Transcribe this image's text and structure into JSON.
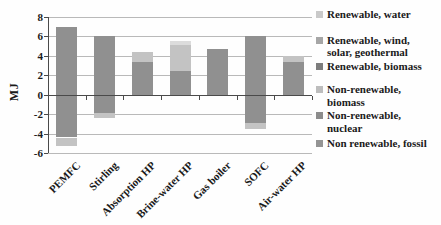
{
  "chart_data": {
    "type": "bar",
    "stacked": true,
    "title": "",
    "xlabel": "",
    "ylabel": "MJ",
    "ylim": [
      -6,
      8
    ],
    "yticks": [
      8,
      6,
      4,
      2,
      0,
      -2,
      -4,
      -6
    ],
    "grid": "horizontal",
    "legend_position": "right",
    "categories": [
      "PEMFC",
      "Stirling",
      "Absorption HP",
      "Brine-water HP",
      "Gas boiler",
      "SOFC",
      "Air-water HP"
    ],
    "shade_colors": {
      "dark": "#909090",
      "light": "#c3c3c3",
      "lightest": "#dcdcdc"
    },
    "bars": [
      {
        "category": "PEMFC",
        "segments": [
          {
            "shade": "dark",
            "from": 0,
            "to": 7.0
          },
          {
            "shade": "dark",
            "from": 0,
            "to": -4.4
          },
          {
            "shade": "light",
            "from": -4.4,
            "to": -5.3
          }
        ]
      },
      {
        "category": "Stirling",
        "segments": [
          {
            "shade": "dark",
            "from": 0,
            "to": 6.0
          },
          {
            "shade": "dark",
            "from": 0,
            "to": -1.9
          },
          {
            "shade": "light",
            "from": -1.9,
            "to": -2.4
          }
        ]
      },
      {
        "category": "Absorption HP",
        "segments": [
          {
            "shade": "dark",
            "from": 0,
            "to": 3.4
          },
          {
            "shade": "light",
            "from": 3.4,
            "to": 4.4
          }
        ]
      },
      {
        "category": "Brine-water HP",
        "segments": [
          {
            "shade": "dark",
            "from": 0,
            "to": 2.4
          },
          {
            "shade": "light",
            "from": 2.4,
            "to": 5.1
          },
          {
            "shade": "lightest",
            "from": 5.1,
            "to": 5.5
          }
        ]
      },
      {
        "category": "Gas boiler",
        "segments": [
          {
            "shade": "dark",
            "from": 0,
            "to": 4.7
          }
        ]
      },
      {
        "category": "SOFC",
        "segments": [
          {
            "shade": "dark",
            "from": 0,
            "to": 6.1
          },
          {
            "shade": "dark",
            "from": 0,
            "to": -2.9
          },
          {
            "shade": "light",
            "from": -2.9,
            "to": -3.5
          }
        ]
      },
      {
        "category": "Air-water HP",
        "segments": [
          {
            "shade": "dark",
            "from": 0,
            "to": 3.4
          },
          {
            "shade": "light",
            "from": 3.4,
            "to": 4.0
          }
        ]
      }
    ],
    "legend": [
      {
        "label": "Renewable, water",
        "color": "#c9c9c9"
      },
      {
        "label": "Renewable, wind, solar, geothermal",
        "color": "#a6a6a6"
      },
      {
        "label": "Renewable, biomass",
        "color": "#7d7d7d"
      },
      {
        "label": "Non-renewable, biomass",
        "color": "#bdbdbd"
      },
      {
        "label": "Non-renewable, nuclear",
        "color": "#8c8c8c"
      },
      {
        "label": "Non renewable, fossil",
        "color": "#949494"
      }
    ]
  }
}
